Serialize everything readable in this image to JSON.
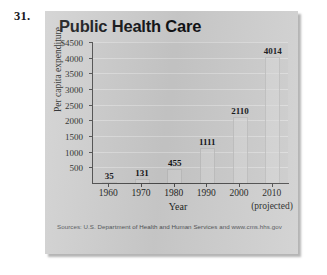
{
  "exercise": {
    "number": "31."
  },
  "figure": {
    "title": "Public Health Care",
    "source": "Sources: U.S. Department of Health and Human Services and www.cms.hhs.gov",
    "projected_note": "(projected)"
  },
  "chart_data": {
    "type": "bar",
    "title": "Public Health Care",
    "xlabel": "Year",
    "ylabel": "Per capita expenditure",
    "categories": [
      "1960",
      "1970",
      "1980",
      "1990",
      "2000",
      "2010"
    ],
    "values": [
      35,
      131,
      455,
      1111,
      2110,
      4014
    ],
    "value_labels": [
      "35",
      "131",
      "455",
      "1111",
      "2110",
      "4014"
    ],
    "ylim": [
      0,
      4500
    ],
    "yticks": [
      500,
      1000,
      1500,
      2000,
      2500,
      3000,
      3500,
      4000,
      4500
    ],
    "ytick_labels": [
      "500",
      "1000",
      "1500",
      "2000",
      "2500",
      "3000",
      "3500",
      "4000",
      "$4500"
    ],
    "grid": true,
    "legend": "none",
    "annotations": [
      "(projected)"
    ],
    "colors": {
      "plot_background": "#cbcbcb",
      "card_background": "#cfcfcf",
      "bar_fill": "#d8d8d8",
      "axis": "#4b4b4b",
      "gridline": "#dcdcdc",
      "text": "#101114"
    }
  }
}
